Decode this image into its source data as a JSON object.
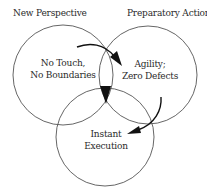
{
  "diagram": {
    "type": "venn",
    "colors": {
      "stroke": "#555555",
      "text": "#2a2a2a",
      "arrow": "#111111",
      "background": "#ffffff"
    },
    "headings": {
      "left": "New Perspective",
      "right": "Preparatory Action"
    },
    "circles": [
      {
        "id": "left",
        "line1": "No Touch,",
        "line2": "No Boundaries"
      },
      {
        "id": "right",
        "line1": "Agility;",
        "line2": "Zero Defects"
      },
      {
        "id": "bottom",
        "line1": "Instant",
        "line2": "Execution"
      }
    ],
    "arrows": [
      {
        "from": "left",
        "to": "right"
      },
      {
        "from": "right",
        "to": "bottom"
      },
      {
        "from": "intersection",
        "to": "bottom"
      }
    ]
  }
}
